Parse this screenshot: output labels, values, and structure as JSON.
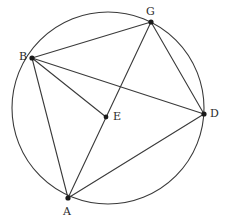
{
  "diagram": {
    "canvas": {
      "width": 228,
      "height": 223,
      "background": "#ffffff"
    },
    "stroke_color": "#3a3a3a",
    "dot_color": "#1a1a1a",
    "label_color": "#2b2b2b",
    "circle": {
      "name": "main-circle",
      "center_x": 108,
      "center_y": 108,
      "radius": 96
    },
    "points": [
      {
        "id": "G",
        "label": "G",
        "x": 151,
        "y": 22,
        "on_circle": true,
        "label_x": 146,
        "label_y": 6,
        "dot_radius": 2.6
      },
      {
        "id": "B",
        "label": "B",
        "x": 32,
        "y": 58,
        "on_circle": true,
        "label_x": 19,
        "label_y": 51,
        "dot_radius": 2.6
      },
      {
        "id": "D",
        "label": "D",
        "x": 204,
        "y": 114,
        "on_circle": true,
        "label_x": 210,
        "label_y": 108,
        "dot_radius": 2.6
      },
      {
        "id": "E",
        "label": "E",
        "x": 106,
        "y": 117,
        "on_circle": false,
        "label_x": 113,
        "label_y": 111,
        "dot_radius": 2.4
      },
      {
        "id": "A",
        "label": "A",
        "x": 68,
        "y": 198,
        "on_circle": true,
        "label_x": 63,
        "label_y": 206,
        "dot_radius": 2.6
      }
    ],
    "segments": [
      {
        "id": "BG",
        "from": "B",
        "to": "G",
        "x1": 32,
        "y1": 58,
        "x2": 151,
        "y2": 22
      },
      {
        "id": "BD",
        "from": "B",
        "to": "D",
        "x1": 32,
        "y1": 58,
        "x2": 204,
        "y2": 114
      },
      {
        "id": "BE",
        "from": "B",
        "to": "E",
        "x1": 32,
        "y1": 58,
        "x2": 106,
        "y2": 117
      },
      {
        "id": "BA",
        "from": "B",
        "to": "A",
        "x1": 32,
        "y1": 58,
        "x2": 68,
        "y2": 198
      },
      {
        "id": "GD",
        "from": "G",
        "to": "D",
        "x1": 151,
        "y1": 22,
        "x2": 204,
        "y2": 114
      },
      {
        "id": "GA",
        "from": "G",
        "to": "A",
        "x1": 151,
        "y1": 22,
        "x2": 68,
        "y2": 198
      },
      {
        "id": "AD",
        "from": "A",
        "to": "D",
        "x1": 68,
        "y1": 198,
        "x2": 204,
        "y2": 114
      }
    ]
  }
}
